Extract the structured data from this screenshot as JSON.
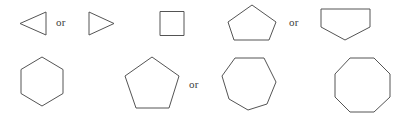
{
  "figure": {
    "background_color": "#ffffff",
    "stroke_color": "#545454",
    "stroke_width": 1,
    "width": 415,
    "height": 119
  },
  "labels": {
    "or_1": "or",
    "or_2": "or",
    "or_3": "or",
    "text_color": "#3a3a3a"
  },
  "shapes": {
    "row1": [
      {
        "name": "triangle-left",
        "sides": 3,
        "orientation": "pointing-left",
        "points": "46,12 20,23.5 46,35"
      },
      {
        "name": "triangle-right",
        "sides": 3,
        "orientation": "pointing-right",
        "points": "89,12 114,23.5 89,35"
      },
      {
        "name": "square",
        "sides": 4,
        "orientation": "axis-aligned",
        "points": "160,11.5 184,11.5 184,35.5 160,35.5"
      },
      {
        "name": "pentagon-up",
        "sides": 5,
        "orientation": "apex-top",
        "points": "252,5 276,22 269,40 234,40 228,22"
      },
      {
        "name": "pentagon-down",
        "sides": 5,
        "orientation": "apex-bottom",
        "points": "321,9 370,9 370,27 345,40 321,27"
      }
    ],
    "row2": [
      {
        "name": "hexagon",
        "sides": 6,
        "orientation": "pointy-top",
        "points": "42,57 63,69.5 63,93.5 42,106 21,93.5 21,69.5"
      },
      {
        "name": "heptagon-apex-top",
        "sides": 7,
        "orientation": "apex-top",
        "points": "152,57 179,76 169,108 136,108 125,76"
      },
      {
        "name": "heptagon-flat-top",
        "sides": 7,
        "orientation": "flat-top",
        "points": "235,58 264,58 276,82 267,104 248,110 229,99 222,76"
      },
      {
        "name": "octagon",
        "sides": 8,
        "orientation": "flat-top",
        "points": "350,58 374,58 390,74 390,97 374,112 350,112 335,97 335,74"
      }
    ]
  }
}
